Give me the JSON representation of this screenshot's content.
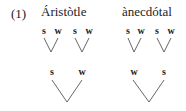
{
  "example_number": "(1)",
  "examples": [
    {
      "word": "Áristòtle",
      "feet": [
        {
          "labels": [
            "s",
            "w"
          ]
        },
        {
          "labels": [
            "s",
            "w"
          ]
        }
      ],
      "upper_labels": [
        "s",
        "w"
      ]
    },
    {
      "word": "ànecdótal",
      "feet": [
        {
          "labels": [
            "s",
            "w"
          ]
        },
        {
          "labels": [
            "s",
            "w"
          ]
        }
      ],
      "upper_labels": [
        "w",
        "s"
      ]
    }
  ]
}
